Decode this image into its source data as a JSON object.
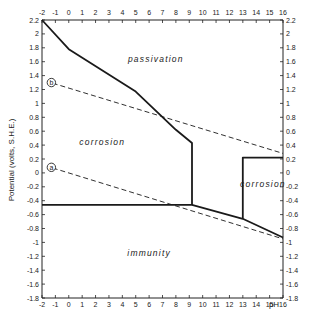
{
  "chart_data": {
    "type": "line",
    "title": "",
    "xlabel": "pH",
    "ylabel": "Potential (volts, S.H.E.)",
    "xlim": [
      -2,
      16
    ],
    "ylim": [
      -1.8,
      2.2
    ],
    "x_ticks": [
      -2,
      -1,
      0,
      1,
      2,
      3,
      4,
      5,
      6,
      7,
      8,
      9,
      10,
      11,
      12,
      13,
      14,
      15,
      16
    ],
    "x_tick_labels": [
      "-2",
      "-1",
      "0",
      "1",
      "2",
      "3",
      "4",
      "5",
      "6",
      "7",
      "8",
      "9",
      "10",
      "11",
      "12",
      "13",
      "14",
      "15",
      "16"
    ],
    "y_ticks": [
      2.2,
      2,
      1.8,
      1.6,
      1.4,
      1.2,
      1,
      0.8,
      0.6,
      0.4,
      0.2,
      0,
      -0.2,
      -0.4,
      -0.6,
      -0.8,
      -1,
      -1.2,
      -1.4,
      -1.6,
      -1.8
    ],
    "y_tick_labels": [
      "2.2",
      "2",
      "1.8",
      "1.6",
      "1.4",
      "1.2",
      "1",
      "0.8",
      "0.6",
      "0.4",
      "0.2",
      "0",
      "-0.2",
      "-0.4",
      "-0.6",
      "-0.8",
      "-1",
      "-1.2",
      "-1.4",
      "-1.6",
      "-1.8"
    ],
    "grid": false,
    "series": [
      {
        "name": "passivation boundary",
        "style": "solid",
        "x": [
          -2,
          0,
          5,
          8,
          9.2,
          9.2
        ],
        "y": [
          2.2,
          1.78,
          1.17,
          0.62,
          0.43,
          -0.46
        ]
      },
      {
        "name": "immunity boundary",
        "style": "solid",
        "x": [
          -2,
          9.2,
          13,
          16
        ],
        "y": [
          -0.46,
          -0.46,
          -0.66,
          -0.93
        ]
      },
      {
        "name": "high-pH corrosion boundary",
        "style": "solid",
        "x": [
          13,
          13,
          16
        ],
        "y": [
          -0.66,
          0.22,
          0.22
        ]
      },
      {
        "name": "line b (O2 evolution)",
        "style": "dashed",
        "x": [
          -1.2,
          16
        ],
        "y": [
          1.29,
          0.28
        ]
      },
      {
        "name": "line a (H2 evolution)",
        "style": "dashed",
        "x": [
          -1.2,
          16
        ],
        "y": [
          0.07,
          -0.95
        ]
      }
    ],
    "regions": [
      {
        "label": "passivation",
        "x": 6.5,
        "y": 1.6
      },
      {
        "label": "corrosion",
        "x": 2.5,
        "y": 0.4
      },
      {
        "label": "corrosion",
        "x": 14.5,
        "y": -0.2
      },
      {
        "label": "immunity",
        "x": 6,
        "y": -1.2
      }
    ],
    "annotations": [
      {
        "label": "b",
        "x": -1.3,
        "y": 1.3
      },
      {
        "label": "a",
        "x": -1.3,
        "y": 0.08
      }
    ],
    "legend": null
  },
  "labels": {
    "region_passivation": "passivation",
    "region_corrosion_left": "corrosion",
    "region_corrosion_right": "corrosion",
    "region_immunity": "immunity",
    "marker_b": "b",
    "marker_a": "a",
    "xlabel": "pH",
    "ylabel": "Potential (volts, S.H.E.)"
  }
}
